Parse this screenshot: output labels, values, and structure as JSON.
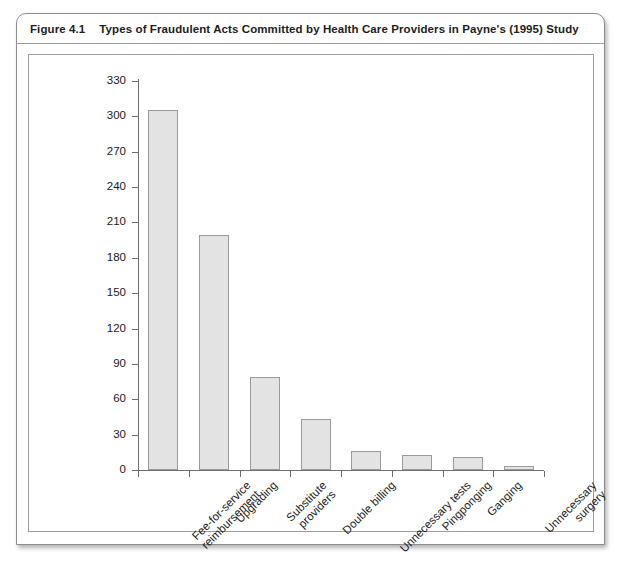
{
  "figure": {
    "number": "Figure 4.1",
    "caption": "Types of Fraudulent Acts Committed by Health Care Providers in Payne's (1995) Study"
  },
  "chart_data": {
    "type": "bar",
    "title": "Types of Fraudulent Acts Committed by Health Care Providers in Payne's (1995) Study",
    "xlabel": "",
    "ylabel": "",
    "ylim": [
      0,
      330
    ],
    "ytick_step": 30,
    "grid": false,
    "legend": false,
    "bar_fill_color": "#e3e3e3",
    "bar_border_color": "#9b9b9b",
    "axis_color": "#6f6f6f",
    "ytick_labels": [
      "0",
      "30",
      "60",
      "90",
      "120",
      "150",
      "180",
      "210",
      "240",
      "270",
      "300",
      "330"
    ],
    "categories": [
      "Fee-for-service reimbursement",
      "Upgrading",
      "Substitute providers",
      "Double billing",
      "Unnecessary tests",
      "Pingponging",
      "Ganging",
      "Unnecessary surgery"
    ],
    "category_lines": [
      [
        "Fee-for-service",
        "reimbursement"
      ],
      [
        "Upgrading",
        ""
      ],
      [
        "Substitute",
        "providers"
      ],
      [
        "Double billing",
        ""
      ],
      [
        "Unnecessary tests",
        ""
      ],
      [
        "Pingponging",
        ""
      ],
      [
        "Ganging",
        ""
      ],
      [
        "Unnecessary",
        "surgery"
      ]
    ],
    "values": [
      305,
      199,
      79,
      43,
      16,
      13,
      11,
      3
    ]
  }
}
